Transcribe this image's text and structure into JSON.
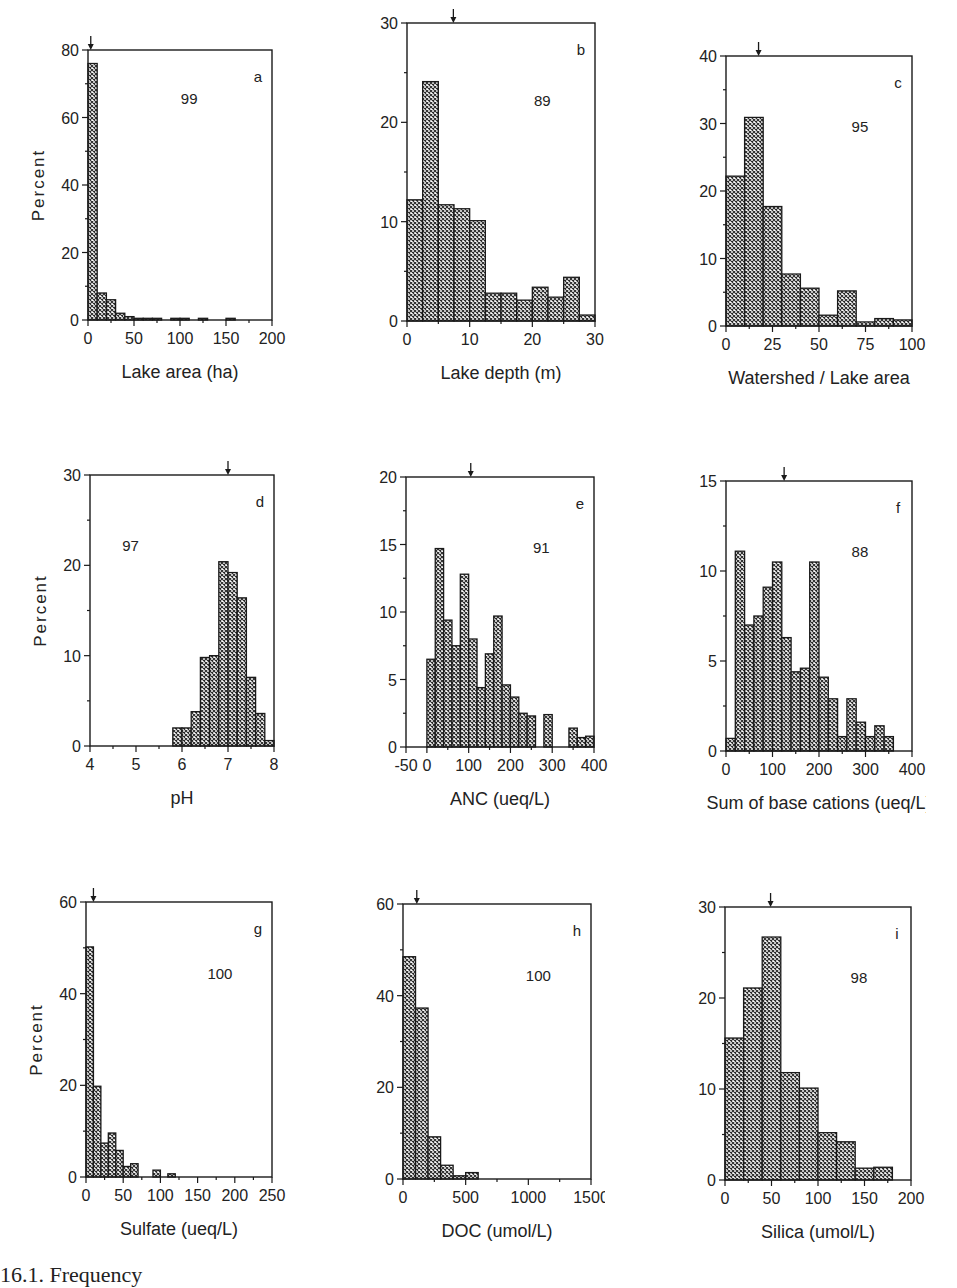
{
  "figure": {
    "ylabel_text": "Percent",
    "caption_fragment": "16.1. Frequency"
  },
  "chart_data": [
    {
      "id": "a",
      "type": "bar",
      "panel_label": "a",
      "n_label": "99",
      "xlabel": "Lake area (ha)",
      "ylabel": "Percent",
      "show_ylabel": true,
      "xlim": [
        0,
        200
      ],
      "ylim": [
        0,
        80
      ],
      "xticks": [
        0,
        50,
        100,
        150,
        200
      ],
      "yticks": [
        0,
        20,
        40,
        60,
        80
      ],
      "y_minor": 10,
      "x_minor": 25,
      "bin_start": 0,
      "bin_width": 10,
      "values": [
        76,
        8,
        6,
        2,
        1,
        0.5,
        0.5,
        0.5,
        0,
        0.5,
        0.5,
        0,
        0.5,
        0,
        0,
        0.5
      ],
      "median_arrow": 3,
      "n_label_pos": [
        0.55,
        0.2
      ]
    },
    {
      "id": "b",
      "type": "bar",
      "panel_label": "b",
      "n_label": "89",
      "xlabel": "Lake depth (m)",
      "ylabel": "",
      "show_ylabel": false,
      "xlim": [
        0,
        30
      ],
      "ylim": [
        0,
        30
      ],
      "xticks": [
        0,
        10,
        20,
        30
      ],
      "yticks": [
        0,
        10,
        20,
        30
      ],
      "y_minor": 5,
      "x_minor": 5,
      "bin_start": 0,
      "bin_width": 2.5,
      "values": [
        12.2,
        24.1,
        11.7,
        11.3,
        10.1,
        2.8,
        2.8,
        2.1,
        3.4,
        2.4,
        4.4,
        0.6
      ],
      "median_arrow": 7.4,
      "n_label_pos": [
        0.72,
        0.28
      ]
    },
    {
      "id": "c",
      "type": "bar",
      "panel_label": "c",
      "n_label": "95",
      "xlabel": "Watershed / Lake area",
      "ylabel": "",
      "show_ylabel": false,
      "xlim": [
        0,
        100
      ],
      "ylim": [
        0,
        40
      ],
      "xticks": [
        0,
        25,
        50,
        75,
        100
      ],
      "yticks": [
        0,
        10,
        20,
        30,
        40
      ],
      "y_minor": 5,
      "x_minor": 12.5,
      "bin_start": 0,
      "bin_width": 10,
      "values": [
        22.2,
        30.9,
        17.7,
        7.7,
        5.6,
        1.6,
        5.2,
        0.6,
        1.1,
        0.9
      ],
      "median_arrow": 17.5,
      "n_label_pos": [
        0.72,
        0.28
      ]
    },
    {
      "id": "d",
      "type": "bar",
      "panel_label": "d",
      "n_label": "97",
      "xlabel": "pH",
      "ylabel": "Percent",
      "show_ylabel": true,
      "xlim": [
        4,
        8
      ],
      "ylim": [
        0,
        30
      ],
      "xticks": [
        4,
        5,
        6,
        7,
        8
      ],
      "yticks": [
        0,
        10,
        20,
        30
      ],
      "y_minor": 5,
      "x_minor": 0.5,
      "bin_start": 5.8,
      "bin_width": 0.2,
      "values": [
        2.0,
        2.0,
        3.8,
        9.8,
        10.0,
        20.4,
        19.2,
        16.4,
        7.6,
        3.6,
        0.6
      ],
      "median_arrow": 7.0,
      "n_label_pos": [
        0.22,
        0.28
      ]
    },
    {
      "id": "e",
      "type": "bar",
      "panel_label": "e",
      "n_label": "91",
      "xlabel": "ANC (ueq/L)",
      "ylabel": "",
      "show_ylabel": false,
      "xlim": [
        -50,
        400
      ],
      "ylim": [
        0,
        20
      ],
      "xticks": [
        -50,
        0,
        100,
        200,
        300,
        400
      ],
      "yticks": [
        0,
        5,
        10,
        15,
        20
      ],
      "y_minor": 2.5,
      "x_minor": 50,
      "bin_start": 0,
      "bin_width": 20,
      "values": [
        6.5,
        14.7,
        9.4,
        7.5,
        12.8,
        8.0,
        4.4,
        6.9,
        9.7,
        4.6,
        3.7,
        2.5,
        2.3,
        0,
        2.4,
        0,
        0,
        1.4,
        0.7,
        0.8
      ],
      "median_arrow": 105,
      "n_label_pos": [
        0.72,
        0.28
      ]
    },
    {
      "id": "f",
      "type": "bar",
      "panel_label": "f",
      "n_label": "88",
      "xlabel": "Sum of base cations (ueq/L)",
      "ylabel": "",
      "show_ylabel": false,
      "xlim": [
        0,
        400
      ],
      "ylim": [
        0,
        15
      ],
      "xticks": [
        0,
        100,
        200,
        300,
        400
      ],
      "yticks": [
        0,
        5,
        10,
        15
      ],
      "y_minor": 2.5,
      "x_minor": 50,
      "bin_start": 0,
      "bin_width": 20,
      "values": [
        0.7,
        11.1,
        7.0,
        7.5,
        9.1,
        10.5,
        6.3,
        4.4,
        4.6,
        10.5,
        4.1,
        2.9,
        0.8,
        2.9,
        1.6,
        0.8,
        1.4,
        0.8
      ],
      "median_arrow": 125,
      "n_label_pos": [
        0.72,
        0.28
      ]
    },
    {
      "id": "g",
      "type": "bar",
      "panel_label": "g",
      "n_label": "100",
      "xlabel": "Sulfate (ueq/L)",
      "ylabel": "Percent",
      "show_ylabel": true,
      "xlim": [
        0,
        250
      ],
      "ylim": [
        0,
        60
      ],
      "xticks": [
        0,
        50,
        100,
        150,
        200,
        250
      ],
      "yticks": [
        0,
        20,
        40,
        60
      ],
      "y_minor": 10,
      "x_minor": 25,
      "bin_start": 0,
      "bin_width": 10,
      "values": [
        50.2,
        19.8,
        7.4,
        9.6,
        5.8,
        2.3,
        2.9,
        0,
        0,
        1.5,
        0,
        0.7
      ],
      "median_arrow": 10,
      "n_label_pos": [
        0.72,
        0.28
      ]
    },
    {
      "id": "h",
      "type": "bar",
      "panel_label": "h",
      "n_label": "100",
      "xlabel": "DOC (umol/L)",
      "ylabel": "",
      "show_ylabel": false,
      "xlim": [
        0,
        1500
      ],
      "ylim": [
        0,
        60
      ],
      "xticks": [
        0,
        500,
        1000,
        1500
      ],
      "yticks": [
        0,
        20,
        40,
        60
      ],
      "y_minor": 10,
      "x_minor": 250,
      "bin_start": 0,
      "bin_width": 100,
      "values": [
        48.5,
        37.3,
        9.2,
        3.0,
        0.7,
        1.4
      ],
      "median_arrow": 110,
      "n_label_pos": [
        0.72,
        0.28
      ]
    },
    {
      "id": "i",
      "type": "bar",
      "panel_label": "i",
      "n_label": "98",
      "xlabel": "Silica (umol/L)",
      "ylabel": "",
      "show_ylabel": false,
      "xlim": [
        0,
        200
      ],
      "ylim": [
        0,
        30
      ],
      "xticks": [
        0,
        50,
        100,
        150,
        200
      ],
      "yticks": [
        0,
        10,
        20,
        30
      ],
      "y_minor": 5,
      "x_minor": 25,
      "bin_start": 0,
      "bin_width": 20,
      "values": [
        15.6,
        21.1,
        26.7,
        11.8,
        10.1,
        5.2,
        4.2,
        1.3,
        1.4
      ],
      "median_arrow": 49,
      "n_label_pos": [
        0.72,
        0.28
      ]
    }
  ],
  "layout": {
    "frames": [
      {
        "left": 88,
        "top": 50,
        "width": 184,
        "height": 270
      },
      {
        "left": 407,
        "top": 23,
        "width": 188,
        "height": 298
      },
      {
        "left": 726,
        "top": 56,
        "width": 186,
        "height": 270
      },
      {
        "left": 90,
        "top": 475,
        "width": 184,
        "height": 271
      },
      {
        "left": 406,
        "top": 477,
        "width": 188,
        "height": 270
      },
      {
        "left": 726,
        "top": 481,
        "width": 186,
        "height": 270
      },
      {
        "left": 86,
        "top": 902,
        "width": 186,
        "height": 275
      },
      {
        "left": 403,
        "top": 904,
        "width": 188,
        "height": 275
      },
      {
        "left": 725,
        "top": 907,
        "width": 186,
        "height": 273
      }
    ],
    "fill_color": "#3a3a3a",
    "line_color": "#1a1a1a"
  }
}
